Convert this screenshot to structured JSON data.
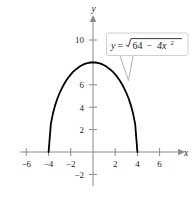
{
  "chart_data": {
    "type": "line",
    "title": "",
    "subtitle": "",
    "xlabel": "x",
    "ylabel": "y",
    "equation_label": "y = √(64 − 4x²)",
    "equation_parts": {
      "lhs": "y",
      "equals": "=",
      "radicand_a": "64",
      "minus": "−",
      "radicand_b": "4x",
      "exponent": "2"
    },
    "xlim": [
      -7.5,
      7.8
    ],
    "ylim": [
      -3.5,
      12
    ],
    "xticks": [
      -6,
      -4,
      -2,
      2,
      4,
      6
    ],
    "xtick_labels": [
      "−6",
      "−4",
      "−2",
      "2",
      "4",
      "6"
    ],
    "yticks": [
      -2,
      2,
      4,
      6,
      8,
      10
    ],
    "ytick_labels": [
      "−2",
      "2",
      "4",
      "6",
      "",
      "10"
    ],
    "grid": false,
    "legend": "none",
    "series": [
      {
        "name": "y = √(64 − 4x²)",
        "color": "#000000",
        "domain": [
          -4,
          4
        ],
        "x": [
          -4,
          -3.8,
          -3.6,
          -3.4,
          -3.2,
          -3,
          -2.8,
          -2.6,
          -2.4,
          -2.2,
          -2,
          -1.8,
          -1.6,
          -1.4,
          -1.2,
          -1,
          -0.8,
          -0.6,
          -0.4,
          -0.2,
          0,
          0.2,
          0.4,
          0.6,
          0.8,
          1,
          1.2,
          1.4,
          1.6,
          1.8,
          2,
          2.2,
          2.4,
          2.6,
          2.8,
          3,
          3.2,
          3.4,
          3.6,
          3.8,
          4
        ],
        "y": [
          0,
          2.49,
          3.48,
          4.21,
          4.8,
          5.29,
          5.71,
          6.07,
          6.4,
          6.68,
          6.93,
          7.15,
          7.33,
          7.48,
          7.63,
          7.75,
          7.84,
          7.91,
          7.96,
          7.99,
          8,
          7.99,
          7.96,
          7.91,
          7.84,
          7.75,
          7.63,
          7.48,
          7.33,
          7.15,
          6.93,
          6.68,
          6.4,
          6.07,
          5.71,
          5.29,
          4.8,
          4.21,
          3.48,
          2.49,
          0
        ]
      }
    ],
    "annotations": [
      {
        "text": "y = √(64 − 4x²)",
        "target_point": [
          3.1,
          6.5
        ],
        "style": "callout-box"
      }
    ],
    "colors": {
      "curve": "#000000",
      "axis": "#8a8a8a",
      "text": "#231f20",
      "callout_border": "#c9c9c9",
      "background": "#ffffff"
    }
  },
  "axis_labels": {
    "x_name": "x",
    "y_name": "y"
  }
}
